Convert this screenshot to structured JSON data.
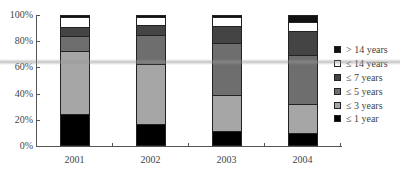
{
  "chart_data": {
    "type": "bar",
    "stacked": true,
    "title": "",
    "xlabel": "",
    "ylabel": "",
    "ylim": [
      0,
      100
    ],
    "y_ticks": [
      "0%",
      "20%",
      "40%",
      "60%",
      "80%",
      "100%"
    ],
    "categories": [
      "2001",
      "2002",
      "2003",
      "2004"
    ],
    "series": [
      {
        "name": "≤ 1 year",
        "color": "#000000",
        "values": [
          24,
          16,
          11,
          9
        ]
      },
      {
        "name": "≤ 3 years",
        "color": "#a6a6a6",
        "values": [
          48,
          46,
          27,
          22
        ]
      },
      {
        "name": "≤ 5 years",
        "color": "#6e6e6e",
        "values": [
          11,
          22,
          40,
          38
        ]
      },
      {
        "name": "≤ 7 years",
        "color": "#444444",
        "values": [
          7,
          8,
          13,
          18
        ]
      },
      {
        "name": "≤ 14 years",
        "color": "#ffffff",
        "values": [
          8,
          6,
          7,
          7
        ]
      },
      {
        "name": "> 14 years",
        "color": "#111111",
        "values": [
          2,
          2,
          2,
          6
        ]
      }
    ],
    "legend_position": "right",
    "legend_order": [
      "> 14 years",
      "≤ 14 years",
      "≤ 7 years",
      "≤ 5 years",
      "≤ 3 years",
      "≤ 1 year"
    ],
    "grid": false
  }
}
